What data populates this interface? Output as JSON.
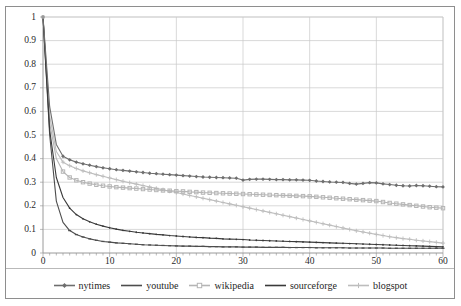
{
  "chart_data": {
    "type": "line",
    "title": "",
    "xlabel": "",
    "ylabel": "",
    "xlim": [
      0,
      60
    ],
    "ylim": [
      0,
      1
    ],
    "grid": true,
    "legend_position": "bottom",
    "x_ticks": [
      "0",
      "10",
      "20",
      "30",
      "40",
      "50",
      "60"
    ],
    "x_tick_values": [
      0,
      10,
      20,
      30,
      40,
      50,
      60
    ],
    "y_ticks": [
      "0",
      "0.1",
      "0.2",
      "0.3",
      "0.4",
      "0.5",
      "0.6",
      "0.7",
      "0.8",
      "0.9",
      "1"
    ],
    "y_tick_values": [
      0,
      0.1,
      0.2,
      0.3,
      0.4,
      0.5,
      0.6,
      0.7,
      0.8,
      0.9,
      1
    ],
    "x": [
      0,
      1,
      2,
      3,
      4,
      5,
      6,
      7,
      8,
      9,
      10,
      11,
      12,
      13,
      14,
      15,
      16,
      17,
      18,
      19,
      20,
      21,
      22,
      23,
      24,
      25,
      26,
      27,
      28,
      29,
      30,
      31,
      32,
      33,
      34,
      35,
      36,
      37,
      38,
      39,
      40,
      41,
      42,
      43,
      44,
      45,
      46,
      47,
      48,
      49,
      50,
      51,
      52,
      53,
      54,
      55,
      56,
      57,
      58,
      59,
      60
    ],
    "series": [
      {
        "name": "nytimes",
        "color": "#6e6e6e",
        "marker": "diamond",
        "values": [
          1,
          0.62,
          0.46,
          0.41,
          0.395,
          0.385,
          0.378,
          0.372,
          0.366,
          0.361,
          0.357,
          0.353,
          0.35,
          0.347,
          0.344,
          0.341,
          0.338,
          0.336,
          0.334,
          0.332,
          0.33,
          0.328,
          0.326,
          0.324,
          0.322,
          0.321,
          0.32,
          0.319,
          0.318,
          0.317,
          0.309,
          0.312,
          0.313,
          0.313,
          0.312,
          0.311,
          0.311,
          0.31,
          0.31,
          0.309,
          0.308,
          0.305,
          0.303,
          0.301,
          0.3,
          0.299,
          0.295,
          0.292,
          0.295,
          0.298,
          0.297,
          0.293,
          0.29,
          0.287,
          0.285,
          0.284,
          0.286,
          0.285,
          0.283,
          0.281,
          0.28
        ]
      },
      {
        "name": "youtube",
        "color": "#4d4d4d",
        "marker": "line",
        "values": [
          1,
          0.5,
          0.22,
          0.13,
          0.095,
          0.078,
          0.068,
          0.06,
          0.054,
          0.049,
          0.046,
          0.043,
          0.041,
          0.039,
          0.037,
          0.035,
          0.034,
          0.033,
          0.032,
          0.031,
          0.03,
          0.029,
          0.029,
          0.028,
          0.028,
          0.027,
          0.027,
          0.026,
          0.026,
          0.026,
          0.025,
          0.025,
          0.025,
          0.024,
          0.024,
          0.024,
          0.024,
          0.023,
          0.023,
          0.023,
          0.023,
          0.022,
          0.022,
          0.022,
          0.022,
          0.022,
          0.021,
          0.021,
          0.021,
          0.021,
          0.021,
          0.021,
          0.02,
          0.02,
          0.02,
          0.02,
          0.02,
          0.02,
          0.02,
          0.02,
          0.02
        ]
      },
      {
        "name": "wikipedia",
        "color": "#b5b5b5",
        "marker": "square",
        "values": [
          1,
          0.55,
          0.4,
          0.345,
          0.32,
          0.308,
          0.3,
          0.294,
          0.289,
          0.285,
          0.282,
          0.279,
          0.277,
          0.275,
          0.273,
          0.271,
          0.269,
          0.267,
          0.265,
          0.264,
          0.262,
          0.261,
          0.259,
          0.258,
          0.256,
          0.255,
          0.254,
          0.253,
          0.252,
          0.251,
          0.25,
          0.249,
          0.248,
          0.247,
          0.246,
          0.245,
          0.244,
          0.243,
          0.242,
          0.241,
          0.24,
          0.238,
          0.236,
          0.234,
          0.232,
          0.23,
          0.228,
          0.226,
          0.224,
          0.222,
          0.22,
          0.216,
          0.212,
          0.209,
          0.206,
          0.203,
          0.2,
          0.197,
          0.194,
          0.192,
          0.19
        ]
      },
      {
        "name": "sourceforge",
        "color": "#3a3a3a",
        "marker": "line-dark",
        "values": [
          1,
          0.52,
          0.32,
          0.235,
          0.19,
          0.163,
          0.145,
          0.132,
          0.122,
          0.114,
          0.107,
          0.101,
          0.096,
          0.092,
          0.088,
          0.085,
          0.082,
          0.079,
          0.077,
          0.074,
          0.072,
          0.07,
          0.068,
          0.066,
          0.065,
          0.063,
          0.062,
          0.06,
          0.059,
          0.058,
          0.057,
          0.055,
          0.054,
          0.053,
          0.052,
          0.051,
          0.05,
          0.049,
          0.048,
          0.047,
          0.046,
          0.045,
          0.044,
          0.043,
          0.042,
          0.041,
          0.04,
          0.039,
          0.038,
          0.037,
          0.036,
          0.035,
          0.034,
          0.033,
          0.032,
          0.031,
          0.03,
          0.029,
          0.028,
          0.027,
          0.026
        ]
      },
      {
        "name": "blogspot",
        "color": "#bdbdbd",
        "marker": "plus",
        "values": [
          1,
          0.58,
          0.43,
          0.385,
          0.37,
          0.358,
          0.348,
          0.34,
          0.332,
          0.325,
          0.318,
          0.311,
          0.304,
          0.298,
          0.292,
          0.286,
          0.28,
          0.274,
          0.268,
          0.262,
          0.256,
          0.25,
          0.244,
          0.238,
          0.232,
          0.226,
          0.22,
          0.214,
          0.208,
          0.202,
          0.196,
          0.19,
          0.184,
          0.178,
          0.172,
          0.166,
          0.16,
          0.154,
          0.148,
          0.142,
          0.136,
          0.13,
          0.124,
          0.118,
          0.112,
          0.106,
          0.1,
          0.094,
          0.089,
          0.084,
          0.079,
          0.074,
          0.069,
          0.065,
          0.061,
          0.058,
          0.054,
          0.051,
          0.048,
          0.045,
          0.042
        ]
      }
    ]
  },
  "legend": {
    "items": [
      {
        "label": "nytimes"
      },
      {
        "label": "youtube"
      },
      {
        "label": "wikipedia"
      },
      {
        "label": "sourceforge"
      },
      {
        "label": "blogspot"
      }
    ]
  }
}
